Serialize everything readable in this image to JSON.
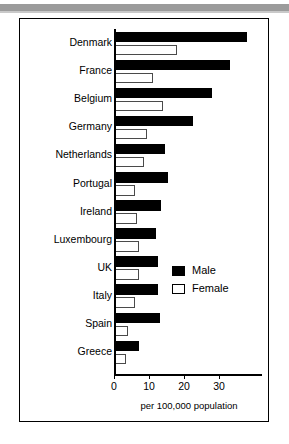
{
  "figure": {
    "xlabel": "per 100,000 population",
    "legend": {
      "male_label": "Male",
      "female_label": "Female",
      "male_swatch_icon": "filled-square-icon",
      "female_swatch_icon": "outlined-square-icon"
    }
  },
  "chart_data": {
    "type": "bar",
    "orientation": "horizontal",
    "title": "",
    "subtitle": "",
    "xlabel": "per 100,000 population",
    "ylabel": "",
    "xlim": [
      0,
      38
    ],
    "xticks": [
      0,
      10,
      20,
      30
    ],
    "xticklabels": [
      "0",
      "10",
      "20",
      "30"
    ],
    "grid": false,
    "legend_position": "center-right",
    "categories": [
      "Denmark",
      "France",
      "Belgium",
      "Germany",
      "Netherlands",
      "Portugal",
      "Ireland",
      "Luxembourg",
      "UK",
      "Italy",
      "Spain",
      "Greece"
    ],
    "series": [
      {
        "name": "Male",
        "color": "#000000",
        "values": [
          38,
          33,
          28,
          22.5,
          14.5,
          15.5,
          13.5,
          12,
          12.5,
          12.5,
          13,
          7
        ]
      },
      {
        "name": "Female",
        "color": "#ffffff",
        "values": [
          18,
          11,
          14,
          9.5,
          8.5,
          6,
          6.5,
          7,
          7,
          6,
          4,
          3.5
        ]
      }
    ]
  }
}
